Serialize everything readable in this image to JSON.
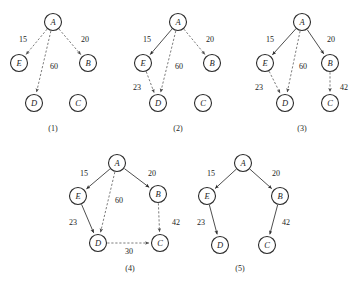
{
  "figure": {
    "node_radius": 8.5,
    "colors": {
      "node_stroke": "#2b2b2b",
      "node_fill": "#ffffff",
      "solid_edge": "#3a3a3a",
      "dashed_edge": "#6d6d6d",
      "text": "#1c1c1c",
      "background": "#ffffff"
    }
  },
  "panels": [
    {
      "caption": "(1)",
      "caption_pos": {
        "x": 53,
        "y": 128
      },
      "nodes": [
        {
          "id": "A",
          "label": "A",
          "x": 53,
          "y": 22
        },
        {
          "id": "E",
          "label": "E",
          "x": 19,
          "y": 63
        },
        {
          "id": "B",
          "label": "B",
          "x": 88,
          "y": 63
        },
        {
          "id": "D",
          "label": "D",
          "x": 34,
          "y": 103
        },
        {
          "id": "C",
          "label": "C",
          "x": 78,
          "y": 103
        }
      ],
      "edges": [
        {
          "from": "A",
          "to": "E",
          "weight": "15",
          "style": "dashed",
          "label_x": 23,
          "label_y": 39
        },
        {
          "from": "A",
          "to": "B",
          "weight": "20",
          "style": "dashed",
          "label_x": 85,
          "label_y": 39
        },
        {
          "from": "A",
          "to": "D",
          "weight": "60",
          "style": "dashed",
          "label_x": 54,
          "label_y": 66
        }
      ]
    },
    {
      "caption": "(2)",
      "caption_pos": {
        "x": 178,
        "y": 128
      },
      "nodes": [
        {
          "id": "A",
          "label": "A",
          "x": 178,
          "y": 22
        },
        {
          "id": "E",
          "label": "E",
          "x": 143,
          "y": 63
        },
        {
          "id": "B",
          "label": "B",
          "x": 212,
          "y": 63
        },
        {
          "id": "D",
          "label": "D",
          "x": 158,
          "y": 103
        },
        {
          "id": "C",
          "label": "C",
          "x": 203,
          "y": 103
        }
      ],
      "edges": [
        {
          "from": "A",
          "to": "E",
          "weight": "15",
          "style": "solid",
          "label_x": 147,
          "label_y": 39
        },
        {
          "from": "A",
          "to": "B",
          "weight": "20",
          "style": "dashed",
          "label_x": 210,
          "label_y": 39
        },
        {
          "from": "A",
          "to": "D",
          "weight": "60",
          "style": "dashed",
          "label_x": 179,
          "label_y": 66
        },
        {
          "from": "E",
          "to": "D",
          "weight": "23",
          "style": "dashed",
          "label_x": 137,
          "label_y": 87
        }
      ]
    },
    {
      "caption": "(3)",
      "caption_pos": {
        "x": 302,
        "y": 128
      },
      "nodes": [
        {
          "id": "A",
          "label": "A",
          "x": 302,
          "y": 22
        },
        {
          "id": "E",
          "label": "E",
          "x": 265,
          "y": 63
        },
        {
          "id": "B",
          "label": "B",
          "x": 330,
          "y": 63
        },
        {
          "id": "D",
          "label": "D",
          "x": 285,
          "y": 103
        },
        {
          "id": "C",
          "label": "C",
          "x": 330,
          "y": 103
        }
      ],
      "edges": [
        {
          "from": "A",
          "to": "E",
          "weight": "15",
          "style": "solid",
          "label_x": 270,
          "label_y": 39
        },
        {
          "from": "A",
          "to": "B",
          "weight": "20",
          "style": "solid",
          "label_x": 331,
          "label_y": 39
        },
        {
          "from": "A",
          "to": "D",
          "weight": "60",
          "style": "dashed",
          "label_x": 303,
          "label_y": 66
        },
        {
          "from": "E",
          "to": "D",
          "weight": "23",
          "style": "dashed",
          "label_x": 259,
          "label_y": 87
        },
        {
          "from": "B",
          "to": "C",
          "weight": "42",
          "style": "dashed",
          "label_x": 344,
          "label_y": 87
        }
      ]
    },
    {
      "caption": "(4)",
      "caption_pos": {
        "x": 130,
        "y": 268
      },
      "nodes": [
        {
          "id": "A",
          "label": "A",
          "x": 117,
          "y": 163
        },
        {
          "id": "E",
          "label": "E",
          "x": 78,
          "y": 196
        },
        {
          "id": "B",
          "label": "B",
          "x": 158,
          "y": 194
        },
        {
          "id": "D",
          "label": "D",
          "x": 98,
          "y": 243
        },
        {
          "id": "C",
          "label": "C",
          "x": 160,
          "y": 243
        }
      ],
      "edges": [
        {
          "from": "A",
          "to": "E",
          "weight": "15",
          "style": "solid",
          "label_x": 84,
          "label_y": 173
        },
        {
          "from": "A",
          "to": "B",
          "weight": "20",
          "style": "solid",
          "label_x": 152,
          "label_y": 173
        },
        {
          "from": "A",
          "to": "D",
          "weight": "60",
          "style": "dashed",
          "label_x": 119,
          "label_y": 200
        },
        {
          "from": "E",
          "to": "D",
          "weight": "23",
          "style": "solid",
          "label_x": 73,
          "label_y": 222
        },
        {
          "from": "B",
          "to": "C",
          "weight": "42",
          "style": "dashed",
          "label_x": 176,
          "label_y": 222
        },
        {
          "from": "D",
          "to": "C",
          "weight": "30",
          "style": "dashed",
          "label_x": 129,
          "label_y": 251
        }
      ]
    },
    {
      "caption": "(5)",
      "caption_pos": {
        "x": 240,
        "y": 268
      },
      "nodes": [
        {
          "id": "A",
          "label": "A",
          "x": 243,
          "y": 163
        },
        {
          "id": "E",
          "label": "E",
          "x": 207,
          "y": 196
        },
        {
          "id": "B",
          "label": "B",
          "x": 280,
          "y": 196
        },
        {
          "id": "D",
          "label": "D",
          "x": 220,
          "y": 245
        },
        {
          "id": "C",
          "label": "C",
          "x": 267,
          "y": 245
        }
      ],
      "edges": [
        {
          "from": "A",
          "to": "E",
          "weight": "15",
          "style": "solid",
          "label_x": 211,
          "label_y": 173
        },
        {
          "from": "A",
          "to": "B",
          "weight": "20",
          "style": "solid",
          "label_x": 276,
          "label_y": 173
        },
        {
          "from": "E",
          "to": "D",
          "weight": "23",
          "style": "solid",
          "label_x": 201,
          "label_y": 222
        },
        {
          "from": "B",
          "to": "C",
          "weight": "42",
          "style": "solid",
          "label_x": 286,
          "label_y": 222
        }
      ]
    }
  ]
}
